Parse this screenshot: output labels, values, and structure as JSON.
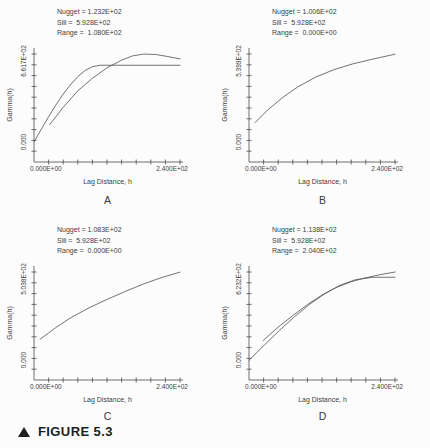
{
  "figure": {
    "caption": "FIGURE 5.3",
    "panels": [
      {
        "label": "A",
        "annotations": {
          "nugget": "Nugget = 1.232E+02",
          "sill": "Sill =  5.928E+02",
          "range": "Range =  1.080E+02"
        },
        "y_axis": {
          "label": "Gamma(h)",
          "top_tick": "6.617E+02",
          "bottom_tick": "0.000"
        },
        "x_axis": {
          "label": "Lag Distance, h",
          "left_tick": "0.000E+00",
          "right_tick": "2.400E+02"
        }
      },
      {
        "label": "B",
        "annotations": {
          "nugget": "Nugget = 1.006E+02",
          "sill": "Sill =  5.928E+02",
          "range": "Range =  0.000E+00"
        },
        "y_axis": {
          "label": "Gamma(h)",
          "top_tick": "5.399E+02",
          "bottom_tick": "0.000"
        },
        "x_axis": {
          "label": "Lag Distance, h",
          "left_tick": "0.000E+00",
          "right_tick": "2.400E+02"
        }
      },
      {
        "label": "C",
        "annotations": {
          "nugget": "Nugget = 1.083E+02",
          "sill": "Sill =  5.928E+02",
          "range": "Range =  0.000E+00"
        },
        "y_axis": {
          "label": "Gamma(h)",
          "top_tick": "5.038E+02",
          "bottom_tick": "0.000"
        },
        "x_axis": {
          "label": "Lag Distance, h",
          "left_tick": "0.000E+00",
          "right_tick": "2.400E+02"
        }
      },
      {
        "label": "D",
        "annotations": {
          "nugget": "Nugget = 1.138E+02",
          "sill": "Sill =  5.928E+02",
          "range": "Range =  2.040E+02"
        },
        "y_axis": {
          "label": "Gamma(h)",
          "top_tick": "6.232E+02",
          "bottom_tick": "0.000"
        },
        "x_axis": {
          "label": "Lag Distance, h",
          "left_tick": "0.000E+00",
          "right_tick": "2.400E+02"
        }
      }
    ]
  },
  "colors": {
    "ink": "#3c3c3c",
    "axis": "#4a4a4a",
    "caption": "#1e1e1e",
    "background": "#fcfcfc"
  },
  "chart_data": [
    {
      "type": "line",
      "panel": "A",
      "title": "",
      "xlabel": "Lag Distance, h",
      "ylabel": "Gamma(h)",
      "xlim": [
        0,
        240
      ],
      "ylim": [
        0,
        661.7
      ],
      "grid": false,
      "legend": "none",
      "params": {
        "nugget": 123.2,
        "sill": 592.8,
        "range": 108.0
      },
      "series": [
        {
          "name": "spherical-model",
          "x": [
            0,
            12,
            24,
            36,
            48,
            60,
            72,
            84,
            96,
            108,
            240
          ],
          "y": [
            123.2,
            201,
            277,
            349,
            416,
            474,
            523,
            561,
            584,
            592.8,
            592.8
          ]
        },
        {
          "name": "experimental-variogram",
          "x": [
            26,
            48,
            72,
            96,
            120,
            144,
            162,
            180,
            200,
            220,
            240
          ],
          "y": [
            230,
            335,
            436,
            513,
            577,
            624,
            650,
            661,
            659,
            646,
            632
          ]
        }
      ]
    },
    {
      "type": "line",
      "panel": "B",
      "title": "",
      "xlabel": "Lag Distance, h",
      "ylabel": "Gamma(h)",
      "xlim": [
        0,
        240
      ],
      "ylim": [
        0,
        539.9
      ],
      "grid": false,
      "legend": "none",
      "params": {
        "nugget": 100.6,
        "sill": 592.8,
        "range": 0.0
      },
      "series": [
        {
          "name": "experimental-variogram",
          "x": [
            10,
            30,
            55,
            80,
            110,
            140,
            170,
            200,
            240
          ],
          "y": [
            197,
            258,
            322,
            375,
            425,
            462,
            490,
            512,
            539
          ]
        }
      ]
    },
    {
      "type": "line",
      "panel": "C",
      "title": "",
      "xlabel": "Lag Distance, h",
      "ylabel": "Gamma(h)",
      "xlim": [
        0,
        240
      ],
      "ylim": [
        0,
        503.8
      ],
      "grid": false,
      "legend": "none",
      "params": {
        "nugget": 108.3,
        "sill": 592.8,
        "range": 0.0
      },
      "series": [
        {
          "name": "experimental-variogram",
          "x": [
            10,
            35,
            60,
            90,
            120,
            150,
            180,
            210,
            240
          ],
          "y": [
            190,
            243,
            290,
            336,
            376,
            413,
            448,
            478,
            503
          ]
        }
      ]
    },
    {
      "type": "line",
      "panel": "D",
      "title": "",
      "xlabel": "Lag Distance, h",
      "ylabel": "Gamma(h)",
      "xlim": [
        0,
        240
      ],
      "ylim": [
        0,
        623.2
      ],
      "grid": false,
      "legend": "none",
      "params": {
        "nugget": 113.8,
        "sill": 592.8,
        "range": 204.0
      },
      "series": [
        {
          "name": "spherical-model",
          "x": [
            0,
            25,
            50,
            75,
            100,
            125,
            150,
            175,
            204,
            240
          ],
          "y": [
            113.8,
            201,
            286,
            366,
            438,
            499,
            547,
            579,
            592.8,
            592.8
          ]
        },
        {
          "name": "experimental-variogram",
          "x": [
            23,
            48,
            72,
            96,
            120,
            144,
            168,
            192,
            216,
            240
          ],
          "y": [
            227,
            305,
            372,
            435,
            490,
            535,
            567,
            590,
            608,
            623
          ]
        }
      ]
    }
  ]
}
